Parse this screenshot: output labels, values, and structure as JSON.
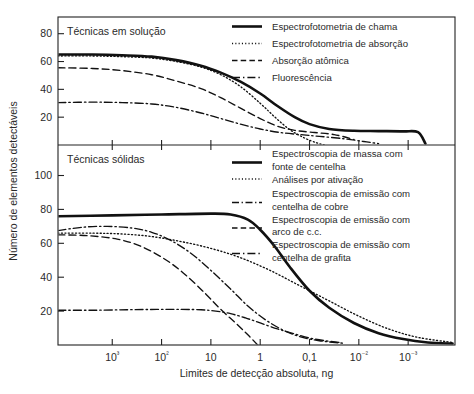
{
  "chart_data": {
    "type": "line",
    "title": "",
    "xlabel": "Limites de detecção absoluta, ng",
    "ylabel": "Número de elementos detectáveis",
    "xscale": "log-decreasing",
    "x_tick_labels": [
      "10³",
      "10²",
      "10",
      "1",
      "0,1",
      "10⁻²",
      "10⁻³"
    ],
    "x_tick_values": [
      1000,
      100,
      10,
      1,
      0.1,
      0.01,
      0.001
    ],
    "xlim_exponents": [
      4.1,
      -3.95
    ],
    "grid": false,
    "panels": [
      {
        "name": "upper",
        "panel_title": "Técnicas em solução",
        "ylabel_ticks": [
          "20",
          "40",
          "60",
          "80"
        ],
        "y_tick_values": [
          20,
          40,
          60,
          80
        ],
        "ylim": [
          0,
          92
        ],
        "legend_position": "top-right-inside",
        "series": [
          {
            "name": "Espectrofotometria de chama",
            "style": "solid-bold",
            "x_exp": [
              4.1,
              3.4,
              2.8,
              2.2,
              1.7,
              1.2,
              0.8,
              0.4,
              0.0,
              -0.35,
              -0.7,
              -1.0,
              -1.4,
              -1.9,
              -2.4,
              -2.9,
              -3.2,
              -3.35
            ],
            "values": [
              65,
              65,
              64.5,
              63.5,
              61,
              57,
              52,
              45.5,
              37,
              28,
              20,
              15,
              11.5,
              10.2,
              10,
              9.8,
              9.2,
              1
            ]
          },
          {
            "name": "Espectrofotometria de absorção",
            "style": "dotted",
            "x_exp": [
              4.1,
              3.4,
              2.8,
              2.2,
              1.7,
              1.2,
              0.8,
              0.4,
              0.0,
              -0.3,
              -0.6,
              -0.9,
              -1.15,
              -1.3
            ],
            "values": [
              64,
              64,
              63.5,
              62.5,
              60,
              56,
              50.5,
              42,
              30,
              20,
              11,
              5,
              1.5,
              0
            ]
          },
          {
            "name": "Absorção atômica",
            "style": "dashed",
            "x_exp": [
              4.1,
              3.4,
              2.8,
              2.2,
              1.7,
              1.2,
              0.8,
              0.4,
              0.0,
              -0.35,
              -0.7,
              -1.1,
              -1.5,
              -1.9
            ],
            "values": [
              55.5,
              55,
              53.5,
              50.5,
              46,
              40.5,
              34,
              26.5,
              19,
              13.5,
              10.5,
              9,
              7.5,
              4
            ]
          },
          {
            "name": "Fluorescência",
            "style": "dashdot",
            "x_exp": [
              4.1,
              3.4,
              2.8,
              2.2,
              1.7,
              1.2,
              0.8,
              0.4,
              0.0,
              -0.4,
              -0.8,
              -1.2,
              -1.7,
              -2.1,
              -2.4
            ],
            "values": [
              30.5,
              30.8,
              30.5,
              29.5,
              27,
              23,
              19,
              15,
              11.5,
              9,
              7.5,
              6.2,
              4.5,
              2.5,
              1
            ]
          }
        ]
      },
      {
        "name": "lower",
        "panel_title": "Técnicas sólidas",
        "ylabel_ticks": [
          "20",
          "40",
          "60",
          "80",
          "100"
        ],
        "y_tick_values": [
          20,
          40,
          60,
          80,
          100
        ],
        "ylim": [
          0,
          118
        ],
        "legend_position": "top-right-inside",
        "series": [
          {
            "name": "Espectroscopia de massa com fonte de centelha",
            "style": "solid-bold",
            "x_exp": [
              4.1,
              3.0,
              2.0,
              1.0,
              0.6,
              0.25,
              0.0,
              -0.3,
              -0.6,
              -1.0,
              -1.4,
              -1.9,
              -2.4,
              -2.9,
              -3.4,
              -3.9
            ],
            "values": [
              76,
              76.5,
              77,
              77.5,
              77,
              74,
              68,
              58,
              46,
              32,
              22,
              13,
              7,
              3.5,
              1.5,
              0.8
            ]
          },
          {
            "name": "Análises por ativação",
            "style": "dotted",
            "x_exp": [
              4.1,
              3.4,
              2.8,
              2.2,
              1.6,
              1.0,
              0.4,
              -0.2,
              -0.8,
              -1.4,
              -2.0,
              -2.6,
              -3.2,
              -3.9
            ],
            "values": [
              66,
              66,
              65.5,
              64,
              61,
              57,
              51.5,
              44,
              35,
              26,
              17,
              9.5,
              4.5,
              1.5
            ]
          },
          {
            "name": "Espectroscopia de emissão com centelha de cobre",
            "style": "dashdot-short",
            "x_exp": [
              4.1,
              3.6,
              3.1,
              2.6,
              2.2,
              1.8,
              1.4,
              1.0,
              0.6,
              0.25,
              -0.1,
              -0.45,
              -0.8,
              -1.2,
              -1.7
            ],
            "values": [
              67.5,
              69.5,
              70,
              69,
              66.5,
              61.5,
              54,
              44,
              33,
              23,
              15,
              9,
              5,
              2.5,
              1
            ]
          },
          {
            "name": "Espectroscopia de emissão com arco de c.c.",
            "style": "dashed",
            "x_exp": [
              4.1,
              3.5,
              2.9,
              2.4,
              1.9,
              1.5,
              1.1,
              0.8,
              0.5,
              0.25,
              0.05
            ],
            "values": [
              65,
              64.5,
              62.5,
              58,
              50,
              41,
              30,
              21,
              13,
              6,
              0
            ]
          },
          {
            "name": "Espectroscopia de emissão com centelha de grafita",
            "style": "dashdot",
            "x_exp": [
              4.1,
              3.4,
              2.7,
              2.1,
              1.6,
              1.2,
              0.9,
              0.6,
              0.3,
              0.0,
              -0.35,
              -0.7,
              -1.1,
              -1.6
            ],
            "values": [
              20.5,
              20.5,
              20.8,
              21,
              21,
              20.8,
              20,
              18.5,
              16,
              13,
              9.5,
              6.5,
              3.5,
              1.5
            ]
          }
        ]
      }
    ],
    "legend_upper": [
      {
        "label": "Espectrofotometria de chama",
        "style": "solid-bold"
      },
      {
        "label": "Espectrofotometria de absorção",
        "style": "dotted"
      },
      {
        "label": "Absorção atômica",
        "style": "dashed"
      },
      {
        "label": "Fluorescência",
        "style": "dashdot"
      }
    ],
    "legend_lower": [
      {
        "line1": "Espectroscopia de massa com",
        "line2": "fonte de centelha",
        "style": "solid-bold"
      },
      {
        "line1": "Análises por ativação",
        "line2": "",
        "style": "dotted"
      },
      {
        "line1": "Espectroscopia de emissão com",
        "line2": "centelha de cobre",
        "style": "dashdot-short"
      },
      {
        "line1": "Espectroscopia de emissão com",
        "line2": "arco de c.c.",
        "style": "dashed"
      },
      {
        "line1": "Espectroscopia de emissão com",
        "line2": "centelha de grafita",
        "style": "dashdot"
      }
    ]
  }
}
